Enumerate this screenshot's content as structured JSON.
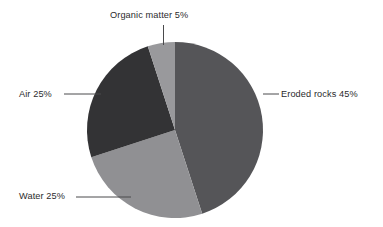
{
  "chart_data": {
    "type": "pie",
    "title": "",
    "subtitle": "",
    "xlabel": "",
    "ylabel": "",
    "categories": [
      "Eroded rocks",
      "Water",
      "Air",
      "Organic matter"
    ],
    "values": [
      45,
      25,
      25,
      5
    ],
    "unit": "%",
    "start_angle_deg": 0,
    "direction": "clockwise",
    "center": {
      "x": 175,
      "y": 130
    },
    "radius": 88,
    "grid": false,
    "legend": "none",
    "labels_position": "outside-with-leader-lines",
    "slices": [
      {
        "name": "Eroded rocks",
        "value": 45,
        "label": "Eroded rocks 45%",
        "color": "#555558",
        "start_deg": 0,
        "end_deg": 162
      },
      {
        "name": "Water",
        "value": 25,
        "label": "Water 25%",
        "color": "#909093",
        "start_deg": 162,
        "end_deg": 252
      },
      {
        "name": "Air",
        "value": 25,
        "label": "Air 25%",
        "color": "#333335",
        "start_deg": 252,
        "end_deg": 342
      },
      {
        "name": "Organic matter",
        "value": 5,
        "label": "Organic matter 5%",
        "color": "#99999c",
        "start_deg": 342,
        "end_deg": 360
      }
    ]
  },
  "canvas": {
    "background_color": "#ffffff",
    "text_color": "#2b2b2d",
    "leader_line_color": "#4a4a4c"
  },
  "labels": {
    "organic_matter": "Organic matter 5%",
    "eroded_rocks": "Eroded rocks 45%",
    "air": "Air 25%",
    "water": "Water 25%"
  }
}
